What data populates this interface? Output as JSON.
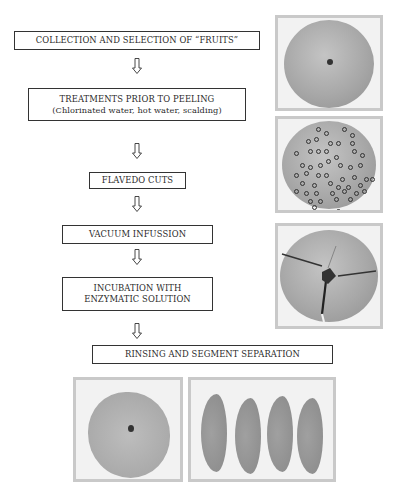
{
  "diagram": {
    "steps": [
      {
        "label": "COLLECTION AND SELECTION OF “FRUITS”"
      },
      {
        "label": "TREATMENTS PRIOR TO PEELING",
        "sublabel": "(Chlorinated water, hot water, scalding)"
      },
      {
        "label": "FLAVEDO CUTS"
      },
      {
        "label": "VACUUM INFUSSION"
      },
      {
        "label": "INCUBATION WITH",
        "sublabel": "ENZYMATIC SOLUTION"
      },
      {
        "label": "RINSING AND SEGMENT SEPARATION"
      }
    ],
    "arrow_icon": "hollow-down-arrow",
    "photos": [
      {
        "name": "whole-fruit-photo",
        "description": "Whole citrus fruit, top view"
      },
      {
        "name": "perforated-fruit-photo",
        "description": "Fruit with circled flavedo cut points"
      },
      {
        "name": "scored-fruit-photo",
        "description": "Fruit with radial flavedo cuts"
      },
      {
        "name": "peeled-fruit-photo",
        "description": "Peeled fruit"
      },
      {
        "name": "segments-photo",
        "description": "Four separated fruit segments"
      }
    ]
  }
}
